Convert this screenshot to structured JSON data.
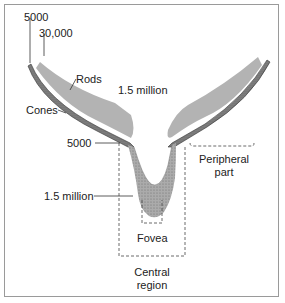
{
  "diagram": {
    "type": "retina photoreceptor distribution cross-section",
    "labels": {
      "cone_count_edge": "5000",
      "rod_count_edge": "30,000",
      "rods": "Rods",
      "rod_count_mid": "1.5 million",
      "cones": "Cones",
      "cone_count_central": "5000",
      "cone_count_fovea": "1.5 million",
      "fovea": "Fovea",
      "peripheral_line1": "Peripheral",
      "peripheral_line2": "part",
      "central_line1": "Central",
      "central_line2": "region"
    },
    "colors": {
      "rods_fill": "#b3b3b3",
      "cones_fill": "#7d7d7d",
      "fovea_fill": "#a8a8a8",
      "frame": "#9a9a9a",
      "text": "#222222"
    }
  }
}
